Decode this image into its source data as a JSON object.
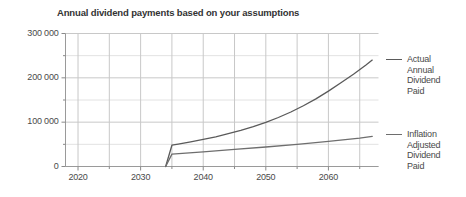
{
  "chart_data": {
    "type": "line",
    "title": "Annual dividend payments based on your assumptions",
    "xlabel": "",
    "ylabel": "",
    "xlim": [
      2018,
      2068
    ],
    "ylim": [
      0,
      300000
    ],
    "grid": true,
    "legend_position": "right",
    "y_ticks": [
      0,
      100000,
      200000,
      300000
    ],
    "y_tick_labels": [
      "0",
      "100 000",
      "200 000",
      "300 000"
    ],
    "y_minor_step": 50000,
    "x_ticks": [
      2020,
      2030,
      2040,
      2050,
      2060
    ],
    "x_tick_labels": [
      "2020",
      "2030",
      "2040",
      "2050",
      "2060"
    ],
    "x_minor_step": 5,
    "line_color": "#5a5a5a",
    "grid_color": "#c8c8c8",
    "minor_grid_color": "#e2e2e2",
    "series": [
      {
        "name": "Actual Annual Dividend Paid",
        "legend_label": "Actual\nAnnual\nDividend\nPaid",
        "color": "#5a5a5a",
        "x": [
          2034,
          2035,
          2036,
          2038,
          2040,
          2042,
          2044,
          2046,
          2048,
          2050,
          2052,
          2054,
          2056,
          2058,
          2060,
          2062,
          2064,
          2066,
          2067
        ],
        "values": [
          0,
          48000,
          50500,
          55500,
          61000,
          67000,
          74000,
          81500,
          90000,
          99500,
          110500,
          123000,
          137000,
          152500,
          170000,
          189000,
          208000,
          229000,
          240000
        ]
      },
      {
        "name": "Inflation Adjusted Dividend Paid",
        "legend_label": "Inflation\nAdjusted\nDividend\nPaid",
        "color": "#6e6e6e",
        "x": [
          2034,
          2035,
          2040,
          2045,
          2050,
          2055,
          2060,
          2065,
          2067
        ],
        "values": [
          0,
          28000,
          33000,
          38500,
          44000,
          50000,
          56500,
          64000,
          68000
        ]
      }
    ]
  }
}
